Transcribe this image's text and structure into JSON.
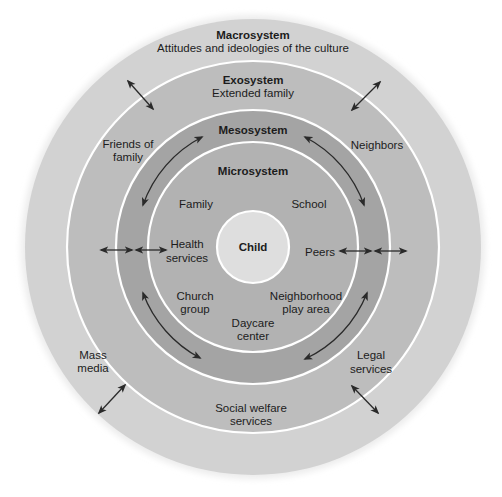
{
  "colors": {
    "background": "#ffffff",
    "macrosystem": "#d2d2d2",
    "exosystem": "#bdbdbd",
    "mesosystem": "#a4a4a4",
    "microsystem": "#b2b2b2",
    "child": "#dedede",
    "ring_border": "#ffffff",
    "text": "#1c1c1c",
    "arrow": "#2a2a2a"
  },
  "center": {
    "label": "Child"
  },
  "layers": {
    "macrosystem": {
      "title": "Macrosystem",
      "subtitle": "Attitudes and ideologies of the culture"
    },
    "exosystem": {
      "title": "Exosystem",
      "subtitle": "Extended family",
      "items": [
        {
          "line1": "Friends of",
          "line2": "family"
        },
        {
          "line1": "Neighbors",
          "line2": ""
        },
        {
          "line1": "Mass",
          "line2": "media"
        },
        {
          "line1": "Legal",
          "line2": "services"
        },
        {
          "line1": "Social welfare",
          "line2": "services"
        }
      ]
    },
    "mesosystem": {
      "title": "Mesosystem"
    },
    "microsystem": {
      "title": "Microsystem",
      "items": [
        {
          "line1": "Family",
          "line2": ""
        },
        {
          "line1": "School",
          "line2": ""
        },
        {
          "line1": "Health",
          "line2": "services"
        },
        {
          "line1": "Peers",
          "line2": ""
        },
        {
          "line1": "Church",
          "line2": "group"
        },
        {
          "line1": "Neighborhood",
          "line2": "play area"
        },
        {
          "line1": "Daycare",
          "line2": "center"
        }
      ]
    }
  }
}
